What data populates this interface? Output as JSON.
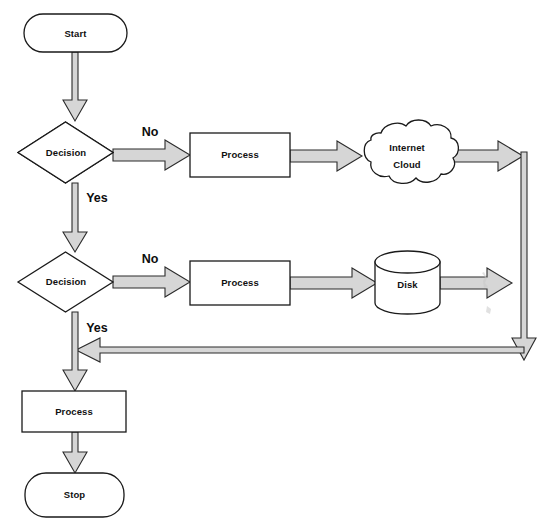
{
  "diagram": {
    "type": "flowchart",
    "background_color": "#ffffff",
    "line_color": "#1a1a1a",
    "arrow_fill_color": "#d6d6d6",
    "width": 547,
    "height": 531
  },
  "nodes": {
    "start": {
      "label": "Start",
      "shape": "rounded-rectangle"
    },
    "decision_1": {
      "label": "Decision",
      "shape": "diamond"
    },
    "process_1": {
      "label": "Process",
      "shape": "rectangle"
    },
    "internet_cloud": {
      "label_line_1": "Internet",
      "label_line_2": "Cloud",
      "shape": "cloud"
    },
    "decision_2": {
      "label": "Decision",
      "shape": "diamond"
    },
    "process_2": {
      "label": "Process",
      "shape": "rectangle"
    },
    "disk": {
      "label": "Disk",
      "shape": "cylinder"
    },
    "process_3": {
      "label": "Process",
      "shape": "rectangle"
    },
    "stop": {
      "label": "Stop",
      "shape": "rounded-rectangle"
    }
  },
  "edge_labels": {
    "decision_1_no": "No",
    "decision_1_yes": "Yes",
    "decision_2_no": "No",
    "decision_2_yes": "Yes"
  }
}
